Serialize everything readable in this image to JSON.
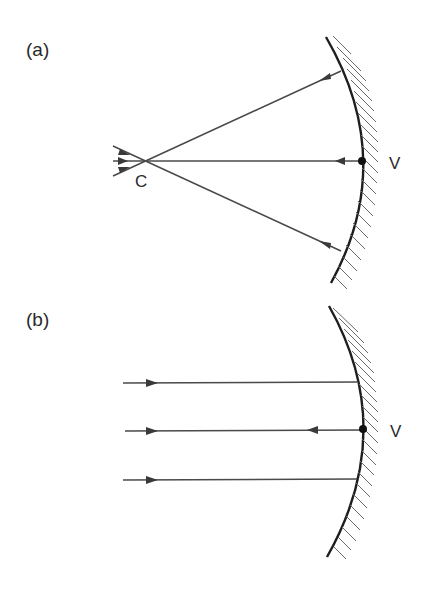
{
  "figure": {
    "panels": [
      {
        "id": "a",
        "label": "(a)",
        "description": "Rays from center of curvature C strike a concave mirror and reflect back through C",
        "points": {
          "center_of_curvature": {
            "label": "C"
          },
          "vertex": {
            "label": "V"
          }
        }
      },
      {
        "id": "b",
        "label": "(b)",
        "description": "Parallel rays incident on concave mirror; axial ray reflects back at vertex V",
        "points": {
          "vertex": {
            "label": "V"
          }
        }
      }
    ],
    "colors": {
      "ray": "#4a4a4a",
      "mirror": "#1e1e1e",
      "hatch": "#6a6a6a",
      "text": "#2a2a2a",
      "background": "#ffffff"
    }
  }
}
